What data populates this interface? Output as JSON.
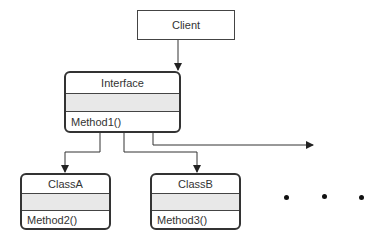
{
  "diagram": {
    "client": {
      "label": "Client"
    },
    "interface": {
      "name": "Interface",
      "method": "Method1()"
    },
    "classes": [
      {
        "name": "ClassA",
        "method": "Method2()"
      },
      {
        "name": "ClassB",
        "method": "Method3()"
      }
    ],
    "ellipsis": "• • •",
    "colors": {
      "stroke": "#333333",
      "attr_fill": "#e8e8e8"
    }
  }
}
